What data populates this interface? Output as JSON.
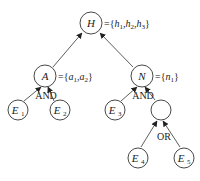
{
  "diagram": {
    "type": "and-or-tree",
    "nodes": {
      "H": {
        "label": "H",
        "sub": "",
        "set_prefix": "={",
        "set_items": [
          {
            "v": "h",
            "s": "1"
          },
          {
            "v": "h",
            "s": "2"
          },
          {
            "v": "h",
            "s": "3"
          }
        ]
      },
      "A": {
        "label": "A",
        "sub": "",
        "set_items": [
          {
            "v": "a",
            "s": "1"
          },
          {
            "v": "a",
            "s": "2"
          }
        ]
      },
      "N": {
        "label": "N",
        "sub": "",
        "set_items": [
          {
            "v": "n",
            "s": "1"
          }
        ]
      },
      "E1": {
        "label": "E",
        "sub": "1"
      },
      "E2": {
        "label": "E",
        "sub": "2"
      },
      "E3": {
        "label": "E",
        "sub": "3"
      },
      "blank": {
        "label": "",
        "sub": ""
      },
      "E4": {
        "label": "E",
        "sub": "4"
      },
      "E5": {
        "label": "E",
        "sub": "5"
      }
    },
    "gates": {
      "and_a": "AND",
      "and_n": "AND",
      "or_blank": "OR"
    },
    "edges": [
      [
        "A",
        "H"
      ],
      [
        "N",
        "H"
      ],
      [
        "E1",
        "A"
      ],
      [
        "E2",
        "A"
      ],
      [
        "E3",
        "N"
      ],
      [
        "blank",
        "N"
      ],
      [
        "E4",
        "blank"
      ],
      [
        "E5",
        "blank"
      ]
    ],
    "colors": {
      "stroke": "#333333",
      "text": "#222222",
      "background": "#ffffff"
    }
  }
}
